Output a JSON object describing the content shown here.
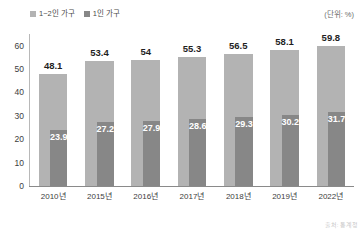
{
  "unit_note": "(단위: %)",
  "source_note": "출처: 통계청",
  "colors": {
    "outer_bar": "#b3b3b3",
    "inner_bar": "#878787",
    "axis": "#8a8a8a",
    "text": "#3d3d3d"
  },
  "legend": {
    "items": [
      {
        "label": "1~2인 가구",
        "color": "#b3b3b3",
        "swatch_name": "legend-swatch-1to2-person-household"
      },
      {
        "label": "1인 가구",
        "color": "#878787",
        "swatch_name": "legend-swatch-1-person-household"
      }
    ]
  },
  "chart_data": {
    "type": "bar",
    "title": "",
    "subtitle": "",
    "xlabel": "",
    "ylabel": "",
    "unit": "%",
    "ylim": [
      0,
      65
    ],
    "yticks": [
      0,
      10,
      20,
      30,
      40,
      50,
      60
    ],
    "ytick_labels": [
      "0",
      "10",
      "20",
      "30",
      "40",
      "50",
      "60"
    ],
    "grid": false,
    "legend_position": "top-left",
    "categories": [
      "2010년",
      "2015년",
      "2016년",
      "2017년",
      "2018년",
      "2019년",
      "2022년"
    ],
    "series": [
      {
        "name": "1~2인 가구",
        "color": "#b3b3b3",
        "values": [
          48.1,
          53.4,
          54,
          55.3,
          56.5,
          58.1,
          59.8
        ],
        "labels": [
          "48.1",
          "53.4",
          "54",
          "55.3",
          "56.5",
          "58.1",
          "59.8"
        ]
      },
      {
        "name": "1인 가구",
        "color": "#878787",
        "values": [
          23.9,
          27.2,
          27.9,
          28.6,
          29.3,
          30.2,
          31.7
        ],
        "labels": [
          "23.9",
          "27.2",
          "27.9",
          "28.6",
          "29.3",
          "30.2",
          "31.7"
        ]
      }
    ]
  }
}
